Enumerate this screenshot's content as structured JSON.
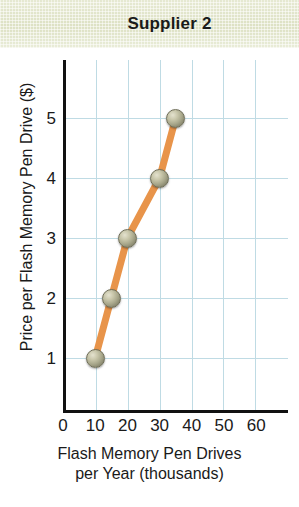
{
  "header": {
    "title": "Supplier 2"
  },
  "chart_data": {
    "type": "line",
    "title": "Supplier 2",
    "xlabel_line1": "Flash Memory Pen Drives",
    "xlabel_line2": "per Year (thousands)",
    "ylabel": "Price per Flash Memory Pen Drive ($)",
    "x": [
      10,
      15,
      20,
      30,
      35
    ],
    "values": [
      1,
      2,
      3,
      4,
      5
    ],
    "points": [
      {
        "x": 10,
        "y": 1
      },
      {
        "x": 15,
        "y": 2
      },
      {
        "x": 20,
        "y": 3
      },
      {
        "x": 30,
        "y": 4
      },
      {
        "x": 35,
        "y": 5
      }
    ],
    "xticks": [
      0,
      10,
      20,
      30,
      40,
      50,
      60
    ],
    "xtick_labels": [
      "0",
      "10",
      "20",
      "30",
      "40",
      "50",
      "60"
    ],
    "yticks": [
      1,
      2,
      3,
      4,
      5
    ],
    "ytick_labels": [
      "1",
      "2",
      "3",
      "4",
      "5"
    ],
    "xlim": [
      0,
      70
    ],
    "ylim": [
      0,
      5.9
    ],
    "grid": true,
    "legend": "none",
    "series_name": "Supply",
    "colors": {
      "line": "#e8944a",
      "marker_fill": "#aaa98d",
      "marker_edge": "#6f6e58",
      "gridline": "#bfdbe4",
      "axis": "#111111",
      "banner_background": "#dfe3c8",
      "text": "#1a1a1a"
    }
  }
}
